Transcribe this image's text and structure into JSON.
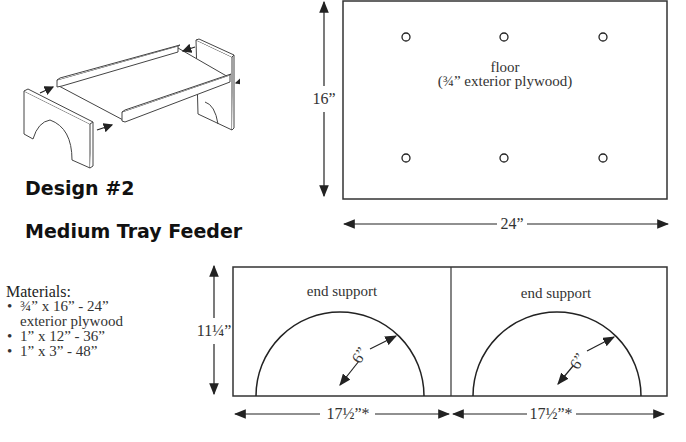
{
  "title": {
    "design": "Design #2",
    "name": "Medium Tray Feeder"
  },
  "materials": {
    "heading": "Materials:",
    "items": [
      {
        "line1": "¾” x 16” - 24”",
        "line2": "exterior plywood"
      },
      {
        "line1": "1” x 12” - 36”"
      },
      {
        "line1": "1” x 3” - 48”"
      }
    ]
  },
  "floor": {
    "label": "floor",
    "sublabel": "(¾” exterior plywood)",
    "height_dim": "16”",
    "width_dim": "24”",
    "holes_per_row": 3,
    "hole_rows": 2
  },
  "end_supports": {
    "height_dim": "11¼”",
    "panels": [
      {
        "label": "end support",
        "radius_dim": "6”",
        "width_dim": "17½”*"
      },
      {
        "label": "end support",
        "radius_dim": "6”",
        "width_dim": "17½”*"
      }
    ]
  },
  "colors": {
    "line": "#333333",
    "text": "#222222",
    "background": "#ffffff"
  }
}
